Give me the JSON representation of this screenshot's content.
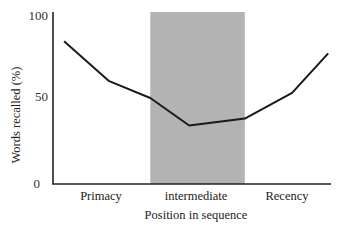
{
  "chart_data": {
    "type": "line",
    "title": "",
    "xlabel": "Position in sequence",
    "ylabel": "Words recalled (%)",
    "ylim": [
      0,
      100
    ],
    "yticks": [
      0,
      50,
      100
    ],
    "ytick_labels": [
      "0",
      "50",
      "100"
    ],
    "categories": [
      "Primacy",
      "intermediate",
      "Recency"
    ],
    "grid": false,
    "legend": null,
    "shaded_region": {
      "label": "intermediate",
      "color": "#b3b3b3",
      "x_start_frac": 0.35,
      "x_end_frac": 0.69
    },
    "series": [
      {
        "name": "Words recalled",
        "color": "#1a1a1a",
        "points": [
          {
            "x_frac": 0.04,
            "y": 83
          },
          {
            "x_frac": 0.2,
            "y": 60
          },
          {
            "x_frac": 0.35,
            "y": 50
          },
          {
            "x_frac": 0.49,
            "y": 34
          },
          {
            "x_frac": 0.69,
            "y": 38
          },
          {
            "x_frac": 0.86,
            "y": 53
          },
          {
            "x_frac": 0.99,
            "y": 76
          }
        ]
      }
    ]
  },
  "labels": {
    "y100": "100",
    "y50": "50",
    "y0": "0",
    "cat_primacy": "Primacy",
    "cat_intermediate": "intermediate",
    "cat_recency": "Recency",
    "xlabel": "Position in sequence",
    "ylabel": "Words recalled (%)"
  }
}
